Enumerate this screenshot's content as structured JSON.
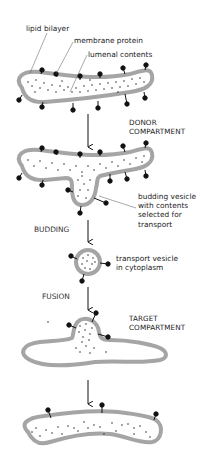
{
  "diagram": {
    "type": "vesicular transport process",
    "labels": {
      "lipid_bilayer": "lipid bilayer",
      "membrane_protein": "membrane protein",
      "lumenal_contents": "lumenal contents",
      "donor_line1": "DONOR",
      "donor_line2": "COMPARTMENT",
      "budding_vesicle_line1": "budding vesicle",
      "budding_vesicle_line2": "with contents",
      "budding_vesicle_line3": "selected for",
      "budding_vesicle_line4": "transport",
      "transport_vesicle_line1": "transport vesicle",
      "transport_vesicle_line2": "in cytoplasm",
      "target_line1": "TARGET",
      "target_line2": "COMPARTMENT"
    },
    "steps": {
      "budding": "BUDDING",
      "fusion": "FUSION"
    },
    "colors": {
      "membrane": "#a0a0a0",
      "lumen": "#ffffff",
      "protein": "#111111",
      "text": "#222222"
    }
  }
}
